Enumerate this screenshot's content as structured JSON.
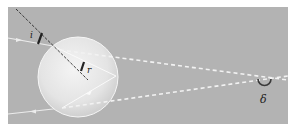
{
  "diagram": {
    "background_color": "#b3b3b3",
    "ray_color": "#e8e8e8",
    "normal_line_color": "#222222",
    "droplet_color": "#eeeeee",
    "labels": {
      "incidence_angle": "i",
      "refraction_angle": "r",
      "deviation_angle": "δ"
    }
  }
}
